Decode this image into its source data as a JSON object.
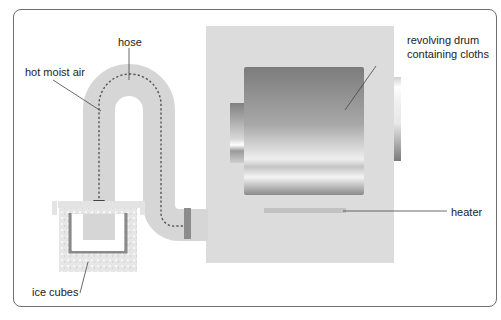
{
  "diagram": {
    "type": "apparatus",
    "labels": {
      "hose": "hose",
      "hot_moist_air": "hot moist air",
      "drum_line1": "revolving drum",
      "drum_line2": "containing cloths",
      "heater": "heater",
      "ice_cubes": "ice cubes"
    },
    "colors": {
      "frame": "#6e6e6e",
      "cabinet": "#dcdcdc",
      "hose": "#d6d6d6",
      "drum_dark": "#7a7a7a",
      "drum_light": "#f2f2f2",
      "ice": "#e4e4e4",
      "container_wall": "#8a8a8a",
      "airflow": "#555555"
    }
  }
}
